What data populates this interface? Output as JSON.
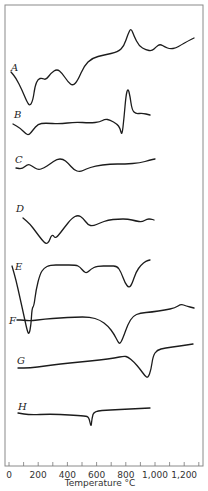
{
  "chart_data": {
    "type": "line",
    "title": "",
    "xlabel": "Temperature °C",
    "ylabel": "",
    "xlim": [
      0,
      1300
    ],
    "x_ticks": [
      0,
      200,
      400,
      600,
      800,
      1000,
      1200
    ],
    "x_tick_labels": [
      "0",
      "200",
      "400",
      "600",
      "800",
      "1,000",
      "1,200"
    ],
    "grid": false,
    "legend": "none (curves labeled inline A–H)",
    "series": [
      {
        "name": "A",
        "events": [
          {
            "x": 150,
            "type": "endotherm"
          },
          {
            "x": 200,
            "type": "small exotherm"
          },
          {
            "x": 330,
            "type": "exotherm"
          },
          {
            "x": 440,
            "type": "endotherm"
          },
          {
            "x": 840,
            "type": "sharp exotherm"
          },
          {
            "x": 1030,
            "type": "small exotherm"
          }
        ],
        "x_range": [
          30,
          1270
        ]
      },
      {
        "name": "B",
        "events": [
          {
            "x": 140,
            "type": "endotherm"
          },
          {
            "x": 770,
            "type": "sharp endotherm"
          },
          {
            "x": 820,
            "type": "sharp exotherm"
          }
        ],
        "x_range": [
          30,
          960
        ]
      },
      {
        "name": "C",
        "events": [
          {
            "x": 200,
            "type": "small endotherm"
          },
          {
            "x": 350,
            "type": "exotherm"
          },
          {
            "x": 500,
            "type": "endotherm"
          }
        ],
        "x_range": [
          50,
          1000
        ]
      },
      {
        "name": "D",
        "events": [
          {
            "x": 260,
            "type": "endotherm"
          },
          {
            "x": 330,
            "type": "endotherm"
          },
          {
            "x": 470,
            "type": "exotherm"
          },
          {
            "x": 560,
            "type": "endotherm"
          }
        ],
        "x_range": [
          80,
          1000
        ]
      },
      {
        "name": "E",
        "events": [
          {
            "x": 140,
            "type": "large endotherm"
          },
          {
            "x": 530,
            "type": "small endotherm"
          },
          {
            "x": 820,
            "type": "endotherm"
          }
        ],
        "x_range": [
          30,
          960
        ]
      },
      {
        "name": "F",
        "events": [
          {
            "x": 760,
            "type": "endotherm"
          },
          {
            "x": 1170,
            "type": "small exotherm"
          }
        ],
        "x_range": [
          50,
          1270
        ]
      },
      {
        "name": "G",
        "events": [
          {
            "x": 950,
            "type": "endotherm"
          }
        ],
        "x_range": [
          60,
          1260
        ]
      },
      {
        "name": "H",
        "events": [
          {
            "x": 570,
            "type": "sharp small endotherm"
          }
        ],
        "x_range": [
          60,
          960
        ]
      }
    ]
  },
  "render": {
    "frame": {
      "left": 5,
      "top": 5,
      "right": 203,
      "bottom": 466
    },
    "x_pixel": {
      "zero": 9,
      "per_100": 14.6
    },
    "curves": [
      {
        "name": "A",
        "label": "A",
        "label_pos": [
          11,
          71
        ],
        "points": [
          [
            11,
            72
          ],
          [
            16,
            78
          ],
          [
            22,
            90
          ],
          [
            27,
            102
          ],
          [
            30,
            106
          ],
          [
            33,
            100
          ],
          [
            35,
            86
          ],
          [
            38,
            79
          ],
          [
            42,
            78
          ],
          [
            46,
            80
          ],
          [
            51,
            73
          ],
          [
            57,
            69
          ],
          [
            62,
            73
          ],
          [
            68,
            82
          ],
          [
            73,
            86
          ],
          [
            78,
            80
          ],
          [
            84,
            66
          ],
          [
            92,
            58
          ],
          [
            104,
            55
          ],
          [
            118,
            52
          ],
          [
            124,
            46
          ],
          [
            128,
            34
          ],
          [
            131,
            28
          ],
          [
            134,
            36
          ],
          [
            139,
            46
          ],
          [
            146,
            50
          ],
          [
            152,
            51
          ],
          [
            156,
            47
          ],
          [
            160,
            44
          ],
          [
            165,
            47
          ],
          [
            170,
            49
          ],
          [
            176,
            48
          ],
          [
            181,
            45
          ],
          [
            188,
            41
          ],
          [
            194,
            38
          ]
        ]
      },
      {
        "name": "B",
        "label": "B",
        "label_pos": [
          14,
          118
        ],
        "points": [
          [
            13,
            124
          ],
          [
            20,
            128
          ],
          [
            26,
            134
          ],
          [
            29,
            135
          ],
          [
            33,
            130
          ],
          [
            38,
            124
          ],
          [
            45,
            123
          ],
          [
            60,
            124
          ],
          [
            75,
            122
          ],
          [
            90,
            123
          ],
          [
            100,
            122
          ],
          [
            105,
            119
          ],
          [
            110,
            120
          ],
          [
            117,
            124
          ],
          [
            120,
            128
          ],
          [
            122,
            136
          ],
          [
            124,
            118
          ],
          [
            126,
            95
          ],
          [
            128,
            88
          ],
          [
            130,
            96
          ],
          [
            132,
            110
          ],
          [
            136,
            114
          ],
          [
            142,
            113
          ],
          [
            150,
            115
          ]
        ]
      },
      {
        "name": "C",
        "label": "C",
        "label_pos": [
          15,
          163
        ],
        "points": [
          [
            16,
            168
          ],
          [
            22,
            169
          ],
          [
            28,
            164
          ],
          [
            32,
            166
          ],
          [
            38,
            170
          ],
          [
            44,
            168
          ],
          [
            50,
            164
          ],
          [
            57,
            159
          ],
          [
            63,
            159
          ],
          [
            68,
            163
          ],
          [
            74,
            170
          ],
          [
            80,
            172
          ],
          [
            86,
            169
          ],
          [
            95,
            166
          ],
          [
            110,
            164
          ],
          [
            125,
            164
          ],
          [
            140,
            163
          ],
          [
            150,
            160
          ],
          [
            155,
            159
          ]
        ]
      },
      {
        "name": "D",
        "label": "D",
        "label_pos": [
          16,
          212
        ],
        "points": [
          [
            23,
            218
          ],
          [
            30,
            224
          ],
          [
            36,
            232
          ],
          [
            42,
            240
          ],
          [
            46,
            244
          ],
          [
            49,
            242
          ],
          [
            51,
            236
          ],
          [
            53,
            235
          ],
          [
            55,
            238
          ],
          [
            58,
            236
          ],
          [
            64,
            228
          ],
          [
            72,
            218
          ],
          [
            78,
            215
          ],
          [
            83,
            218
          ],
          [
            88,
            225
          ],
          [
            93,
            226
          ],
          [
            100,
            223
          ],
          [
            108,
            220
          ],
          [
            118,
            219
          ],
          [
            128,
            219
          ],
          [
            136,
            221
          ],
          [
            142,
            222
          ],
          [
            147,
            219
          ],
          [
            151,
            219
          ],
          [
            154,
            220
          ]
        ]
      },
      {
        "name": "E",
        "label": "E",
        "label_pos": [
          15,
          270
        ],
        "points": [
          [
            12,
            266
          ],
          [
            16,
            280
          ],
          [
            20,
            298
          ],
          [
            24,
            316
          ],
          [
            27,
            330
          ],
          [
            29,
            335
          ],
          [
            31,
            325
          ],
          [
            32,
            308
          ],
          [
            34,
            306
          ],
          [
            36,
            290
          ],
          [
            40,
            274
          ],
          [
            44,
            268
          ],
          [
            50,
            265
          ],
          [
            62,
            265
          ],
          [
            76,
            265
          ],
          [
            80,
            267
          ],
          [
            84,
            272
          ],
          [
            87,
            273
          ],
          [
            91,
            269
          ],
          [
            97,
            266
          ],
          [
            110,
            266
          ],
          [
            117,
            266
          ],
          [
            121,
            272
          ],
          [
            125,
            283
          ],
          [
            129,
            288
          ],
          [
            132,
            284
          ],
          [
            136,
            272
          ],
          [
            141,
            265
          ],
          [
            146,
            261
          ],
          [
            150,
            260
          ]
        ]
      },
      {
        "name": "F",
        "label": "F",
        "label_pos": [
          9,
          324
        ],
        "points": [
          [
            17,
            320
          ],
          [
            24,
            320
          ],
          [
            30,
            321
          ],
          [
            45,
            319
          ],
          [
            60,
            318
          ],
          [
            75,
            317
          ],
          [
            90,
            317
          ],
          [
            100,
            320
          ],
          [
            108,
            326
          ],
          [
            114,
            334
          ],
          [
            118,
            342
          ],
          [
            120,
            344
          ],
          [
            123,
            338
          ],
          [
            128,
            324
          ],
          [
            133,
            316
          ],
          [
            140,
            313
          ],
          [
            152,
            312
          ],
          [
            165,
            310
          ],
          [
            175,
            308
          ],
          [
            181,
            304
          ],
          [
            186,
            306
          ],
          [
            194,
            308
          ]
        ]
      },
      {
        "name": "G",
        "label": "G",
        "label_pos": [
          17,
          364
        ],
        "points": [
          [
            18,
            368
          ],
          [
            30,
            368
          ],
          [
            45,
            366
          ],
          [
            60,
            364
          ],
          [
            80,
            362
          ],
          [
            100,
            360
          ],
          [
            115,
            358
          ],
          [
            124,
            356
          ],
          [
            128,
            357
          ],
          [
            134,
            362
          ],
          [
            140,
            369
          ],
          [
            145,
            376
          ],
          [
            148,
            378
          ],
          [
            151,
            370
          ],
          [
            153,
            356
          ],
          [
            157,
            350
          ],
          [
            165,
            348
          ],
          [
            180,
            346
          ],
          [
            193,
            344
          ]
        ]
      },
      {
        "name": "H",
        "label": "H",
        "label_pos": [
          18,
          410
        ],
        "points": [
          [
            18,
            413
          ],
          [
            30,
            415
          ],
          [
            50,
            414
          ],
          [
            70,
            415
          ],
          [
            85,
            416
          ],
          [
            89,
            417
          ],
          [
            91,
            428
          ],
          [
            92,
            418
          ],
          [
            94,
            411
          ],
          [
            110,
            410
          ],
          [
            130,
            409
          ],
          [
            150,
            408
          ]
        ]
      }
    ]
  }
}
